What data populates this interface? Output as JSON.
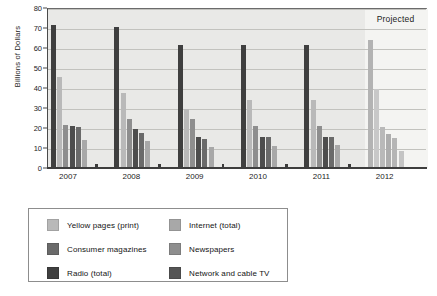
{
  "chart_data": {
    "type": "bar",
    "title": "",
    "subtitle": "",
    "xlabel": "",
    "ylabel": "Billions of Dollars",
    "ylim": [
      0,
      80
    ],
    "ytick_step": 10,
    "yticks": [
      0,
      10,
      20,
      30,
      40,
      50,
      60,
      70,
      80
    ],
    "ytick_labels": [
      "0",
      "10",
      "20",
      "30",
      "40",
      "50",
      "60",
      "70",
      "80"
    ],
    "grid": true,
    "grid_axis": "y",
    "legend_position": "below",
    "categories": [
      "2007",
      "2008",
      "2009",
      "2010",
      "2011",
      "2012"
    ],
    "annotations": [
      {
        "text": "Projected",
        "category": "2012",
        "position": "top-right"
      }
    ],
    "projected_categories": [
      "2012"
    ],
    "series": [
      {
        "name": "Network and cable TV",
        "color": "#3f3f3f",
        "values": [
          71.5,
          70.5,
          61.5,
          61.5,
          61.5,
          64.0
        ]
      },
      {
        "name": "Yellow pages (print)",
        "color": "#b9b9b9",
        "values": [
          45.5,
          37.5,
          29.5,
          34.0,
          34.0,
          39.5
        ]
      },
      {
        "name": "Newspapers",
        "color": "#8e8e8e",
        "values": [
          21.5,
          24.5,
          24.5,
          21.0,
          21.0,
          20.5
        ]
      },
      {
        "name": "Radio (total)",
        "color": "#4d4d4d",
        "values": [
          20.8,
          19.5,
          15.5,
          15.5,
          15.5,
          17.0
        ]
      },
      {
        "name": "Consumer magazines",
        "color": "#6a6a6a",
        "values": [
          20.5,
          17.5,
          14.5,
          15.5,
          15.5,
          15.0
        ]
      },
      {
        "name": "Internet (total)",
        "color": "#a8a8a8",
        "values": [
          14.0,
          13.5,
          10.5,
          11.0,
          11.5,
          8.5
        ]
      }
    ],
    "projected_colors": {
      "Network and cable TV": "#b3b3b3",
      "Yellow pages (print)": "#c8c8c8",
      "Newspapers": "#b9b9b9",
      "Radio (total)": "#adadad",
      "Consumer magazines": "#b5b5b5",
      "Internet (total)": "#c4c4c4"
    },
    "plot_background": "#e9e9e7",
    "projected_background": "#f4f4f2"
  },
  "legend": {
    "items": [
      {
        "label": "Yellow pages (print)",
        "color": "#b9b9b9",
        "column": 0,
        "row": 0
      },
      {
        "label": "Consumer magazines",
        "color": "#6a6a6a",
        "column": 0,
        "row": 1
      },
      {
        "label": "Radio (total)",
        "color": "#3f3f3f",
        "column": 0,
        "row": 2
      },
      {
        "label": "Internet (total)",
        "color": "#a8a8a8",
        "column": 1,
        "row": 0
      },
      {
        "label": "Newspapers",
        "color": "#8e8e8e",
        "column": 1,
        "row": 1
      },
      {
        "label": "Network and cable TV",
        "color": "#555555",
        "column": 1,
        "row": 2
      }
    ]
  }
}
